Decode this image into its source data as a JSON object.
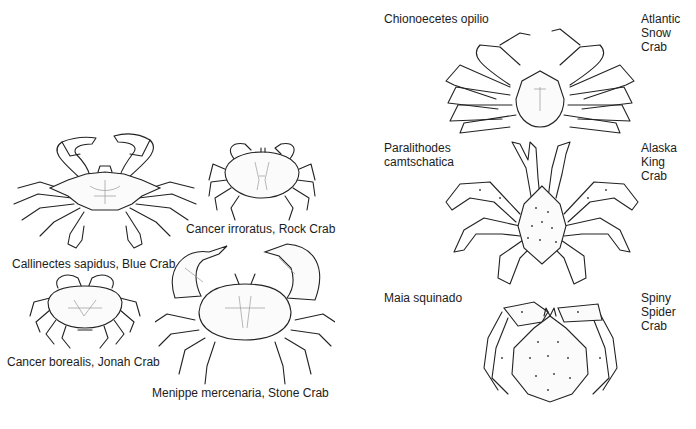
{
  "figure": {
    "background": "#ffffff",
    "ink_color": "#222222",
    "left_panel": {
      "crabs": [
        {
          "id": "blue-crab",
          "label": "Callinectes sapidus, Blue Crab"
        },
        {
          "id": "rock-crab",
          "label": "Cancer irroratus, Rock Crab"
        },
        {
          "id": "jonah-crab",
          "label": "Cancer borealis, Jonah Crab"
        },
        {
          "id": "stone-crab",
          "label": "Menippe mercenaria, Stone Crab"
        }
      ]
    },
    "right_panel": {
      "crabs": [
        {
          "id": "snow-crab",
          "scientific_name": "Chionoecetes opilio",
          "common_name": "Atlantic\nSnow\nCrab"
        },
        {
          "id": "king-crab",
          "scientific_name": "Paralithodes\ncamtschatica",
          "common_name": "Alaska\nKing\nCrab"
        },
        {
          "id": "spider-crab",
          "scientific_name": "Maia squinado",
          "common_name": "Spiny\nSpider\nCrab"
        }
      ]
    }
  }
}
